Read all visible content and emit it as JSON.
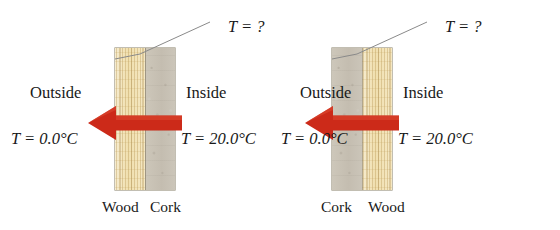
{
  "figure": {
    "background_color": "#ffffff",
    "arrow_color": "#cc2a19",
    "wood_color": "#f0dfae",
    "cork_color": "#c7c1b4",
    "text_color": "#191919"
  },
  "panels": [
    {
      "id": "panel-left",
      "unknown_label": "T = ?",
      "outside_label": "Outside",
      "inside_label": "Inside",
      "outside_temp": "T = 0.0°C",
      "inside_temp": "T = 20.0°C",
      "layers": [
        {
          "name": "Wood",
          "material": "wood",
          "side": "outside"
        },
        {
          "name": "Cork",
          "material": "cork",
          "side": "inside"
        }
      ],
      "material_label_outer": "Wood",
      "material_label_inner": "Cork",
      "heat_flow_direction": "left",
      "arrow_name": "heat-flow-arrow"
    },
    {
      "id": "panel-right",
      "unknown_label": "T = ?",
      "outside_label": "Outside",
      "inside_label": "Inside",
      "outside_temp": "T = 0.0°C",
      "inside_temp": "T = 20.0°C",
      "layers": [
        {
          "name": "Cork",
          "material": "cork",
          "side": "outside"
        },
        {
          "name": "Wood",
          "material": "wood",
          "side": "inside"
        }
      ],
      "material_label_outer": "Cork",
      "material_label_inner": "Wood",
      "heat_flow_direction": "left",
      "arrow_name": "heat-flow-arrow"
    }
  ]
}
